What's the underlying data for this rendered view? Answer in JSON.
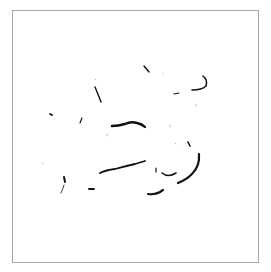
{
  "image": {
    "description": "Faint sketch made of scattered black stroke fragments inside a thin gray square frame",
    "background": "#ffffff",
    "frame_color": "#a8a8a8",
    "ink_color": "#111111",
    "faint_ink_color": "#bdbdbd"
  },
  "strokes": [
    {
      "name": "top-tick",
      "d": "M144,66 L149,72",
      "w": 1.4
    },
    {
      "name": "top-right-hook",
      "d": "M203,76 Q208,80 206,86 Q202,90 192,90",
      "w": 1.6
    },
    {
      "name": "small-dash-top",
      "d": "M174,94 L179,93",
      "w": 1.2
    },
    {
      "name": "left-slanted-line",
      "d": "M95,87 Q98,94 101,102",
      "w": 1.4
    },
    {
      "name": "left-dot",
      "d": "M50,114 L52,115",
      "w": 1.8
    },
    {
      "name": "small-slash",
      "d": "M82,118 L80,123",
      "w": 1.2
    },
    {
      "name": "central-wave",
      "d": "M112,126 Q118,126 125,124 Q131,121 137,123 Q142,124 145,127",
      "w": 2.4
    },
    {
      "name": "right-small-mark",
      "d": "M188,142 L190,146",
      "w": 1.6
    },
    {
      "name": "right-big-curve",
      "d": "M199,154 Q200,166 192,174 Q186,180 178,183",
      "w": 2.2
    },
    {
      "name": "mid-long-line",
      "d": "M100,173 Q106,170 115,169 Q126,166 135,164 L145,161",
      "w": 1.8
    },
    {
      "name": "right-small-curve",
      "d": "M162,173 Q168,178 176,173",
      "w": 1.6
    },
    {
      "name": "mid-tiny-mark",
      "d": "M156,168 L156,172",
      "w": 1.2
    },
    {
      "name": "bottom-left-vertical",
      "d": "M64,177 L65,182",
      "w": 2.0
    },
    {
      "name": "bottom-left-faint",
      "d": "M64,185 Q63,189 61,193",
      "w": 0.8
    },
    {
      "name": "small-dash-bottom",
      "d": "M89,189 L94,189",
      "w": 1.8
    },
    {
      "name": "bottom-dash",
      "d": "M148,194 Q155,195 160,192 L163,190",
      "w": 2.2
    }
  ],
  "faint_marks": [
    {
      "name": "faint-1",
      "d": "M95,79 L96,80",
      "w": 1
    },
    {
      "name": "faint-2",
      "d": "M163,73 L164,74",
      "w": 1
    },
    {
      "name": "faint-3",
      "d": "M196,104 L196,106",
      "w": 1
    },
    {
      "name": "faint-4",
      "d": "M170,125 L170,127",
      "w": 1
    },
    {
      "name": "faint-5",
      "d": "M107,134 L107,136",
      "w": 1
    },
    {
      "name": "faint-6",
      "d": "M42,163 L43,164",
      "w": 1
    },
    {
      "name": "faint-7",
      "d": "M175,143 L176,144",
      "w": 1
    }
  ]
}
